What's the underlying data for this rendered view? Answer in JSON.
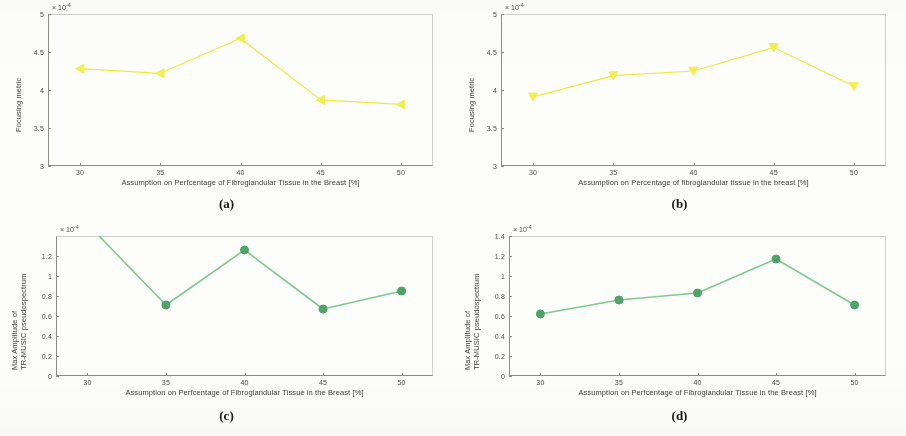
{
  "figure": {
    "background_color": "#fdfdfb",
    "panels": [
      "a",
      "b",
      "c",
      "d"
    ]
  },
  "captions": {
    "a": "(a)",
    "b": "(b)",
    "c": "(c)",
    "d": "(d)"
  },
  "chart_data": [
    {
      "panel": "a",
      "type": "line",
      "title": "",
      "xlabel": "Assumption on Perfcentage of Fibroglandular Tissue in the Breast [%]",
      "ylabel": "Focusing metric",
      "y_exponent_label": "× 10",
      "y_exponent_power": "-4",
      "x": [
        30,
        35,
        40,
        45,
        50
      ],
      "values": [
        4.28,
        4.22,
        4.68,
        3.87,
        3.81
      ],
      "xtick_labels": [
        "30",
        "35",
        "40",
        "45",
        "50"
      ],
      "ytick_labels": [
        "3",
        "3.5",
        "4",
        "4.5",
        "5"
      ],
      "ytick_values": [
        3,
        3.5,
        4,
        4.5,
        5
      ],
      "xlim": [
        28,
        52
      ],
      "ylim": [
        3,
        5
      ],
      "line_color": "#eeea3c",
      "marker_color": "#f2ef52",
      "marker": "triangle-left",
      "grid": false,
      "legend": "none"
    },
    {
      "panel": "b",
      "type": "line",
      "title": "",
      "xlabel": "Assumption on Percentage of fibroglandular tissue in the breast [%]",
      "ylabel": "Focusing metric",
      "y_exponent_label": "× 10",
      "y_exponent_power": "-4",
      "x": [
        30,
        35,
        40,
        45,
        50
      ],
      "values": [
        3.91,
        4.19,
        4.25,
        4.56,
        4.05
      ],
      "xtick_labels": [
        "30",
        "35",
        "40",
        "45",
        "50"
      ],
      "ytick_labels": [
        "3",
        "3.5",
        "4",
        "4.5",
        "5"
      ],
      "ytick_values": [
        3,
        3.5,
        4,
        4.5,
        5
      ],
      "xlim": [
        28,
        52
      ],
      "ylim": [
        3,
        5
      ],
      "line_color": "#eeea3c",
      "marker_color": "#f2ef52",
      "marker": "triangle-down",
      "grid": false,
      "legend": "none"
    },
    {
      "panel": "c",
      "type": "line",
      "title": "",
      "xlabel": "Assumption on Perfcentage of Fibroglandular Tissue in the Breast [%]",
      "ylabel_line1": "Max Amplitude of",
      "ylabel_line2": "TR-MUSIC pseudospectrum",
      "y_exponent_label": "× 10",
      "y_exponent_power": "-4",
      "x": [
        30,
        35,
        40,
        45,
        50
      ],
      "values": [
        1.52,
        0.71,
        1.26,
        0.67,
        0.85
      ],
      "clipped_points": [
        30
      ],
      "xtick_labels": [
        "30",
        "35",
        "40",
        "45",
        "50"
      ],
      "ytick_labels": [
        "0",
        "0.2",
        "0.4",
        "0.6",
        "0.8",
        "1",
        "1.2"
      ],
      "ytick_values": [
        0,
        0.2,
        0.4,
        0.6,
        0.8,
        1,
        1.2
      ],
      "xlim": [
        28,
        52
      ],
      "ylim": [
        0,
        1.4
      ],
      "line_color": "#7fc98f",
      "marker_color": "#4fa268",
      "marker": "circle",
      "grid": false,
      "legend": "none"
    },
    {
      "panel": "d",
      "type": "line",
      "title": "",
      "xlabel": "Assumption on Perfcentage of Fibroglandular Tissue in the Breast [%]",
      "ylabel_line1": "Max Amplitude of",
      "ylabel_line2": "TR-MUSIC pseudospectrum",
      "y_exponent_label": "× 10",
      "y_exponent_power": "-4",
      "x": [
        30,
        35,
        40,
        45,
        50
      ],
      "values": [
        0.62,
        0.76,
        0.83,
        1.17,
        0.71
      ],
      "xtick_labels": [
        "30",
        "35",
        "40",
        "45",
        "50"
      ],
      "ytick_labels": [
        "0",
        "0.2",
        "0.4",
        "0.6",
        "0.8",
        "1",
        "1.2",
        "1.4"
      ],
      "ytick_values": [
        0,
        0.2,
        0.4,
        0.6,
        0.8,
        1,
        1.2,
        1.4
      ],
      "xlim": [
        28,
        52
      ],
      "ylim": [
        0,
        1.4
      ],
      "line_color": "#7fc98f",
      "marker_color": "#4fa268",
      "marker": "circle",
      "grid": false,
      "legend": "none"
    }
  ]
}
